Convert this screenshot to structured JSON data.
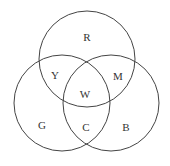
{
  "diagram": {
    "type": "venn",
    "circles": [
      {
        "name": "top",
        "cx": 87,
        "cy": 59,
        "r": 48
      },
      {
        "name": "left",
        "cx": 62,
        "cy": 103,
        "r": 48
      },
      {
        "name": "right",
        "cx": 111,
        "cy": 103,
        "r": 48
      }
    ],
    "stroke_color": "#444444",
    "labels": [
      {
        "text": "R",
        "x": 87,
        "y": 41
      },
      {
        "text": "Y",
        "x": 55,
        "y": 79
      },
      {
        "text": "M",
        "x": 118,
        "y": 80
      },
      {
        "text": "W",
        "x": 85,
        "y": 98
      },
      {
        "text": "G",
        "x": 42,
        "y": 129
      },
      {
        "text": "C",
        "x": 86,
        "y": 131
      },
      {
        "text": "B",
        "x": 126,
        "y": 131
      }
    ]
  }
}
